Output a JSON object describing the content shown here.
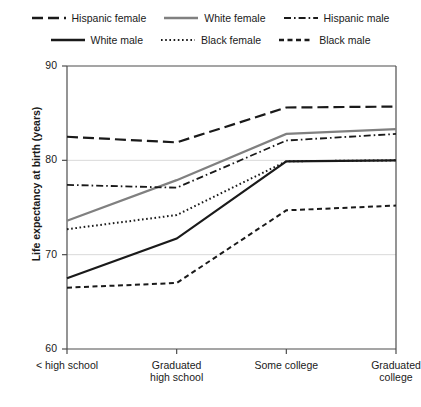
{
  "legend": {
    "rows": [
      [
        {
          "label": "Hispanic female",
          "style": "dashed-long",
          "color": "#1a1a1a"
        },
        {
          "label": "White female",
          "style": "solid-gray",
          "color": "#808080"
        },
        {
          "label": "Hispanic male",
          "style": "dash-dot",
          "color": "#1a1a1a"
        }
      ],
      [
        {
          "label": "White male",
          "style": "solid-black",
          "color": "#1a1a1a"
        },
        {
          "label": "Black female",
          "style": "dotted",
          "color": "#1a1a1a"
        },
        {
          "label": "Black male",
          "style": "dashed-short",
          "color": "#1a1a1a"
        }
      ]
    ]
  },
  "chart_data": {
    "type": "line",
    "title": "",
    "xlabel": "",
    "ylabel": "Life expectancy at birth (years)",
    "categories": [
      "< high school",
      "Graduated high school",
      "Some college",
      "Graduated college"
    ],
    "category_lines": [
      [
        "< high school"
      ],
      [
        "Graduated",
        "high school"
      ],
      [
        "Some college"
      ],
      [
        "Graduated",
        "college"
      ]
    ],
    "ylim": [
      60,
      90
    ],
    "yticks": [
      60,
      70,
      80,
      90
    ],
    "ytick_labels": [
      "60",
      "70",
      "80",
      "90"
    ],
    "grid": "horizontal",
    "legend_position": "top",
    "series": [
      {
        "name": "Hispanic female",
        "style": "dashed-long",
        "color": "#1a1a1a",
        "width": 2.2,
        "values": [
          82.5,
          81.9,
          85.6,
          85.7
        ]
      },
      {
        "name": "White female",
        "style": "solid-gray",
        "color": "#808080",
        "width": 2.2,
        "values": [
          73.6,
          77.9,
          82.8,
          83.3
        ]
      },
      {
        "name": "Hispanic male",
        "style": "dash-dot",
        "color": "#1a1a1a",
        "width": 1.8,
        "values": [
          77.4,
          77.1,
          82.1,
          82.8
        ]
      },
      {
        "name": "White male",
        "style": "solid-black",
        "color": "#1a1a1a",
        "width": 2.2,
        "values": [
          67.5,
          71.7,
          79.9,
          80.0
        ]
      },
      {
        "name": "Black female",
        "style": "dotted",
        "color": "#1a1a1a",
        "width": 2.0,
        "values": [
          72.7,
          74.2,
          79.9,
          80.0
        ]
      },
      {
        "name": "Black male",
        "style": "dashed-short",
        "color": "#1a1a1a",
        "width": 2.0,
        "values": [
          66.5,
          67.0,
          74.7,
          75.2
        ]
      }
    ]
  }
}
